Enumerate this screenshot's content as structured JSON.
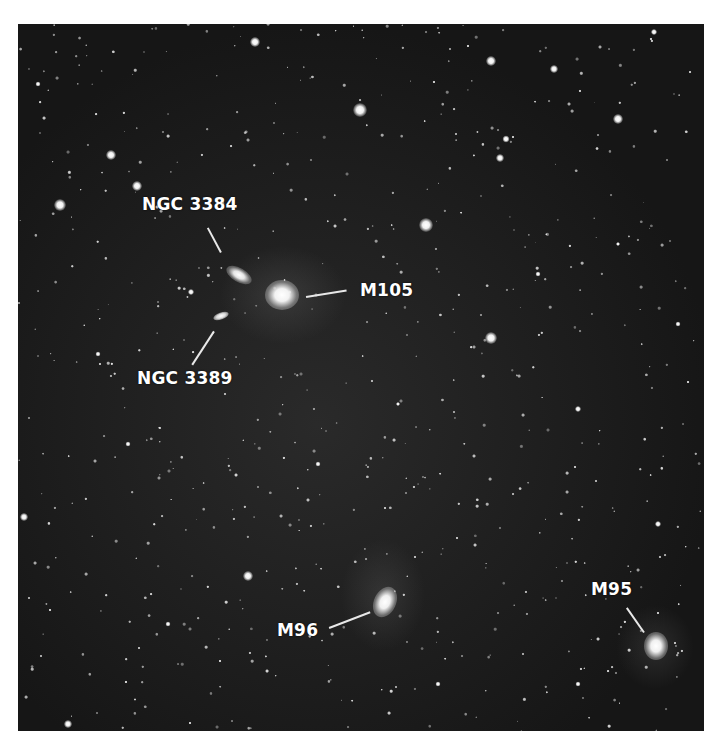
{
  "caption_fragment": "",
  "photo": {
    "description": "Star field with galaxies of the Leo I group",
    "background_color": "#1b1b1b",
    "label_color": "#ffffff"
  },
  "labels": [
    {
      "id": "ngc3384",
      "text": "NGC 3384"
    },
    {
      "id": "m105",
      "text": "M105"
    },
    {
      "id": "ngc3389",
      "text": "NGC 3389"
    },
    {
      "id": "m96",
      "text": "M96"
    },
    {
      "id": "m95",
      "text": "M95"
    }
  ]
}
